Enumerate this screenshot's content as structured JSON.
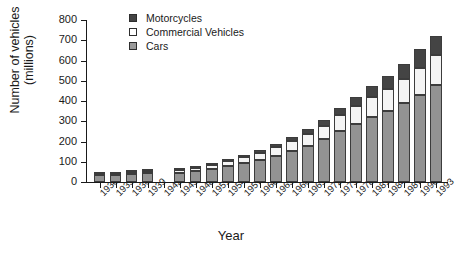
{
  "chart_data": {
    "type": "bar",
    "stacked": true,
    "title": "",
    "xlabel": "Year",
    "ylabel": "Number of vehicles (millions)",
    "ylim": [
      0,
      800
    ],
    "yticks": [
      0,
      100,
      200,
      300,
      400,
      500,
      600,
      700,
      800
    ],
    "grid": false,
    "legend_position": "top-left-inside",
    "categories": [
      "1930",
      "1933",
      "1936",
      "1939",
      "1942",
      "1945",
      "1948",
      "1951",
      "1954",
      "1957",
      "1960",
      "1963",
      "1966",
      "1969",
      "1972",
      "1975",
      "1978",
      "1981",
      "1984",
      "1987",
      "1990",
      "1993"
    ],
    "series": [
      {
        "name": "Cars",
        "color": "#939393",
        "values": [
          35,
          34,
          39,
          43,
          null,
          45,
          52,
          66,
          80,
          95,
          110,
          130,
          155,
          180,
          210,
          250,
          285,
          320,
          350,
          390,
          430,
          480
        ]
      },
      {
        "name": "Commercial Vehicles",
        "color": "#f4f4f4",
        "values": [
          7,
          7,
          8,
          9,
          null,
          12,
          15,
          20,
          25,
          30,
          35,
          42,
          50,
          58,
          68,
          80,
          90,
          100,
          110,
          120,
          135,
          145
        ]
      },
      {
        "name": "Motorcycles",
        "color": "#444444",
        "values": [
          2,
          2,
          2,
          2,
          null,
          3,
          4,
          5,
          7,
          9,
          11,
          14,
          18,
          22,
          28,
          35,
          45,
          55,
          65,
          75,
          90,
          95
        ]
      }
    ],
    "totals": [
      44,
      43,
      49,
      54,
      null,
      60,
      71,
      91,
      112,
      134,
      156,
      186,
      223,
      260,
      306,
      365,
      420,
      475,
      525,
      585,
      655,
      720
    ]
  },
  "legend": {
    "items": [
      {
        "label": "Motorcycles",
        "swatch": "filled-dark"
      },
      {
        "label": "Commercial Vehicles",
        "swatch": "outline-white"
      },
      {
        "label": "Cars",
        "swatch": "filled-gray"
      }
    ]
  },
  "axes": {
    "y_title_line1": "Number of vehicles",
    "y_title_line2": "(millions)",
    "x_title": "Year"
  }
}
